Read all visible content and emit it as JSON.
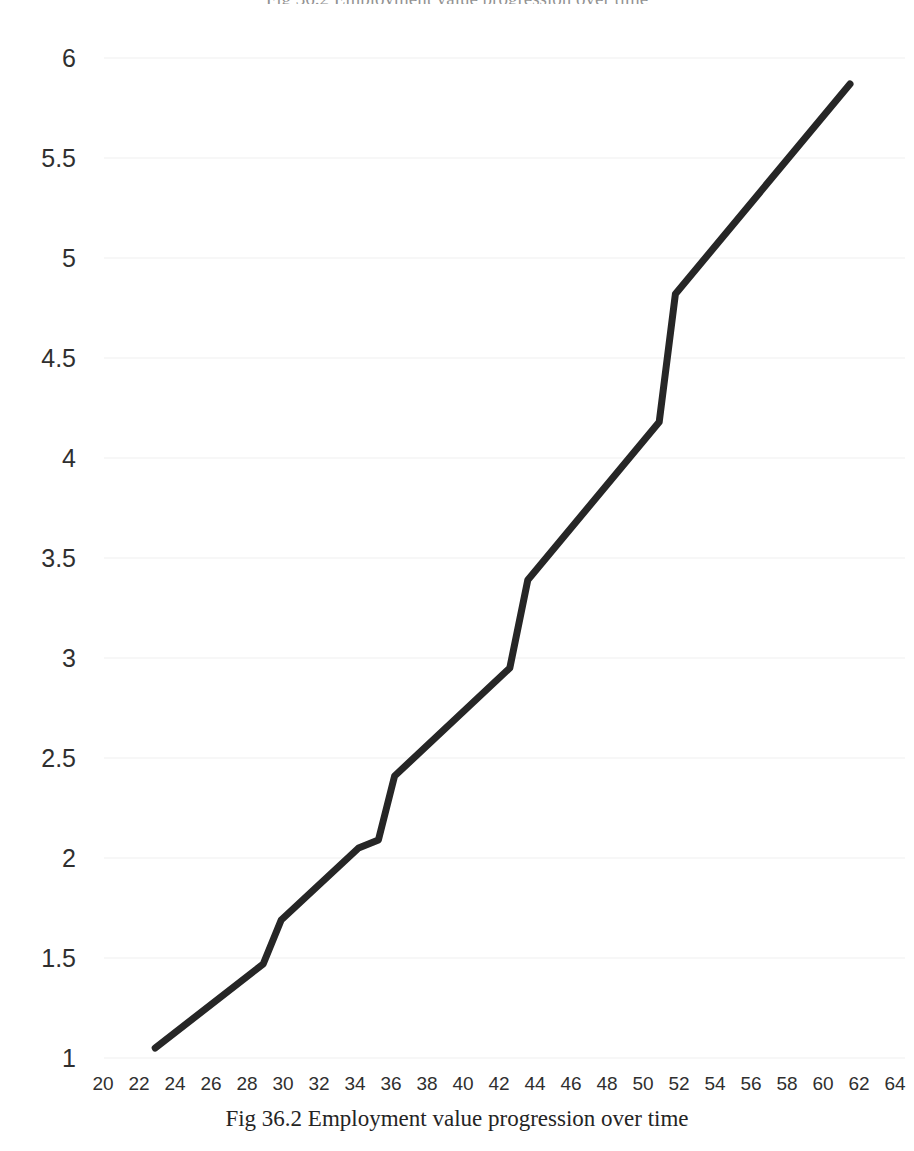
{
  "figure": {
    "caption": "Fig 36.2 Employment value progression over time",
    "title": "Fig 36.2 Employment value progression over time",
    "background_color": "#ffffff",
    "line_color": "#262626",
    "gridline_color": "#f4f4f5",
    "tick_label_color": "#2f2f2f"
  },
  "chart_data": {
    "type": "line",
    "title": "",
    "subtitle": "",
    "xlabel": "",
    "ylabel": "",
    "xlim": [
      19,
      65
    ],
    "ylim": [
      1,
      6
    ],
    "grid": true,
    "grid_axis": "y",
    "legend": false,
    "legend_position": "none",
    "xticks": [
      20,
      22,
      24,
      26,
      28,
      30,
      32,
      34,
      36,
      38,
      40,
      42,
      44,
      46,
      48,
      50,
      52,
      54,
      56,
      58,
      60,
      62,
      64
    ],
    "yticks": [
      1,
      1.5,
      2,
      2.5,
      3,
      3.5,
      4,
      4.5,
      5,
      5.5,
      6
    ],
    "xtick_labels": [
      "20",
      "22",
      "24",
      "26",
      "28",
      "30",
      "32",
      "34",
      "36",
      "38",
      "40",
      "42",
      "44",
      "46",
      "48",
      "50",
      "52",
      "54",
      "56",
      "58",
      "60",
      "62",
      "64"
    ],
    "ytick_labels": [
      "1",
      "1.5",
      "2",
      "2.5",
      "3",
      "3.5",
      "4",
      "4.5",
      "5",
      "5.5",
      "6"
    ],
    "series": [
      {
        "name": "Employment value",
        "color": "#262626",
        "line_width": 7,
        "markers": false,
        "x": [
          22.9,
          28.9,
          29.9,
          34.2,
          35.3,
          36.2,
          42.6,
          43.6,
          50.9,
          51.8,
          61.5
        ],
        "y": [
          1.05,
          1.47,
          1.69,
          2.05,
          2.09,
          2.41,
          2.95,
          3.39,
          4.18,
          4.82,
          5.87
        ]
      }
    ]
  }
}
